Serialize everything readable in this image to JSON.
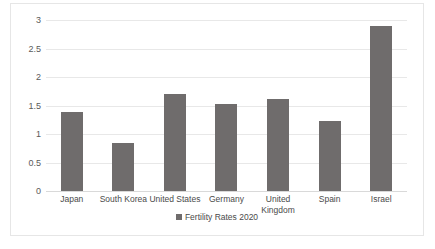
{
  "chart_data": {
    "type": "bar",
    "title": "",
    "subtitle": "",
    "xlabel": "",
    "ylabel": "",
    "categories": [
      "Japan",
      "South Korea",
      "United States",
      "Germany",
      "United Kingdom",
      "Spain",
      "Israel"
    ],
    "series": [
      {
        "name": "Fertility Rates 2020",
        "values": [
          1.38,
          0.84,
          1.71,
          1.53,
          1.61,
          1.23,
          2.9
        ]
      }
    ],
    "values": [
      1.38,
      0.84,
      1.71,
      1.53,
      1.61,
      1.23,
      2.9
    ],
    "ylim": [
      0,
      3
    ],
    "yticks": [
      0,
      0.5,
      1,
      1.5,
      2,
      2.5,
      3
    ],
    "ytick_labels": [
      "0",
      "0.5",
      "1",
      "1.5",
      "2",
      "2.5",
      "3"
    ],
    "grid": true,
    "legend": {
      "position": "bottom",
      "entries": [
        {
          "label": "Fertility Rates 2020",
          "color": "#6f6c6c",
          "marker": "square-swatch"
        }
      ]
    },
    "colors": {
      "bar": "#6f6c6c",
      "gridline": "#e8e8e8",
      "baseline": "#d9d9d9",
      "border": "#e6e6e6",
      "text": "#4a4a4a",
      "background": "#ffffff"
    }
  }
}
